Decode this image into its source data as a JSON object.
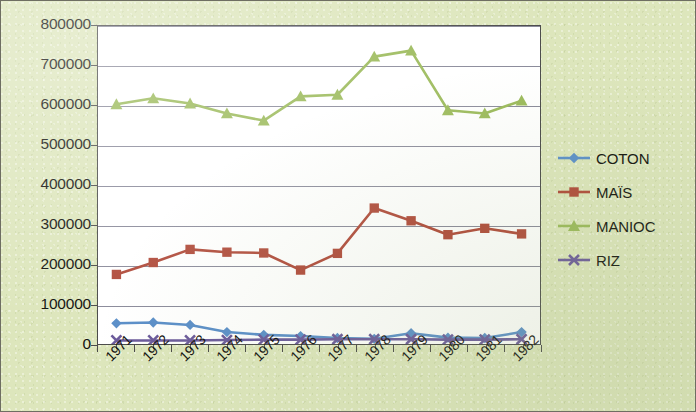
{
  "chart_data": {
    "type": "line",
    "title": "",
    "subtitle": "",
    "xlabel": "",
    "ylabel": "",
    "categories": [
      "1971",
      "1972",
      "1973",
      "1974",
      "1975",
      "1976",
      "1977",
      "1978",
      "1979",
      "1980",
      "1981",
      "1982"
    ],
    "ylim": [
      0,
      800000
    ],
    "ytick_labels": [
      "800000",
      "700000",
      "600000",
      "500000",
      "400000",
      "300000",
      "200000",
      "100000",
      "0"
    ],
    "ytick_values": [
      800000,
      700000,
      600000,
      500000,
      400000,
      300000,
      200000,
      100000,
      0
    ],
    "ytick_step": 100000,
    "grid": true,
    "grid_axis": "y",
    "legend_position": "right",
    "series": [
      {
        "name": "COTON",
        "color": "#5b8fc9",
        "marker": "diamond",
        "values": [
          52000,
          54000,
          48000,
          30000,
          23000,
          20000,
          15000,
          13000,
          27000,
          16000,
          15000,
          30000
        ]
      },
      {
        "name": "MAÏS",
        "color": "#b04a3a",
        "marker": "square",
        "values": [
          175000,
          205000,
          238000,
          231000,
          229000,
          186000,
          228000,
          342000,
          310000,
          275000,
          291000,
          277000
        ]
      },
      {
        "name": "MANIOC",
        "color": "#9bba5a",
        "marker": "triangle",
        "values": [
          603000,
          618000,
          605000,
          580000,
          562000,
          623000,
          627000,
          723000,
          738000,
          588000,
          580000,
          612000
        ]
      },
      {
        "name": "RIZ",
        "color": "#6b5a9b",
        "marker": "cross",
        "values": [
          9000,
          9000,
          9000,
          10000,
          11000,
          11000,
          12000,
          12000,
          12000,
          11000,
          11000,
          12000
        ]
      }
    ]
  },
  "colors": {
    "background": "#dde6bc",
    "plot_background": "#ffffff",
    "axis": "#4b4b4b",
    "gridline": "#8a8a9a",
    "text": "#12120e",
    "coton": "#5b8fc9",
    "mais": "#b04a3a",
    "manioc": "#9bba5a",
    "riz": "#6b5a9b"
  }
}
